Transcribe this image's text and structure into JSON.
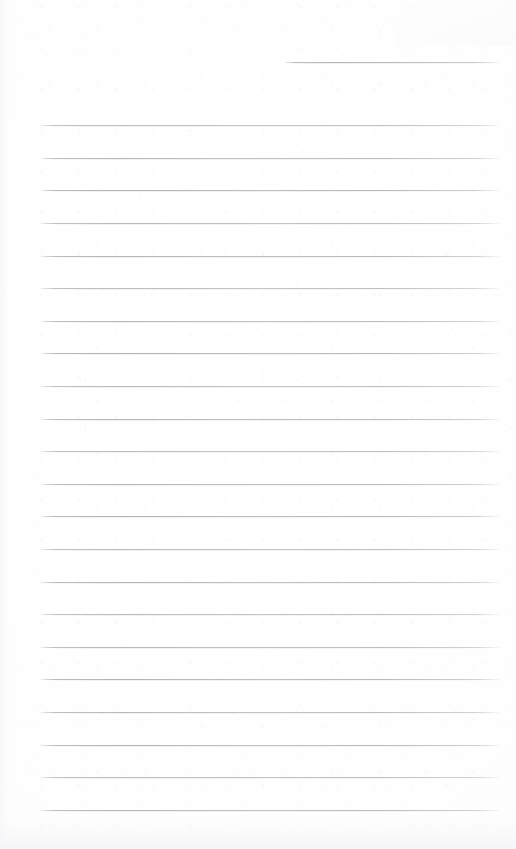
{
  "document": {
    "kind": "scanned-lined-paper",
    "title": "Blank Lined Notepad Page (Scan)",
    "page_width": 516,
    "page_height": 849,
    "paper_color": "#fefefe",
    "rule_color": "#b6b6bb",
    "rule_thickness": 1,
    "text_content": "",
    "has_handwriting": false,
    "has_printed_text": false
  },
  "header_rule": {
    "label": "header rule",
    "x_start": 285,
    "x_end": 500,
    "y": 62,
    "length": 215
  },
  "body_rules": {
    "label": "ruled writing lines",
    "x_start": 41,
    "x_end": 499,
    "length": 458,
    "first_y": 125,
    "spacing": 32.6,
    "count": 22,
    "y_positions": [
      125,
      158,
      190,
      223,
      256,
      288,
      321,
      353,
      386,
      419,
      451,
      484,
      516,
      549,
      582,
      614,
      647,
      679,
      712,
      745,
      777,
      810
    ]
  },
  "artifacts": {
    "bottom_smudge": "faint gray scan band along bottom edge",
    "left_smudge": "faint gray scan band along left edge",
    "grain": "very light paper grain speckle"
  }
}
